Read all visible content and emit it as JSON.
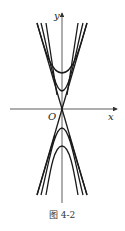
{
  "figure": {
    "caption": "图 4-2",
    "axes": {
      "x_label": "x",
      "y_label": "y",
      "origin_label": "O"
    },
    "colors": {
      "stroke": "#1a1a1a",
      "axis": "#333333",
      "background": "#ffffff"
    },
    "curves": [
      {
        "name": "asymptote-1",
        "type": "line",
        "through": "origin"
      },
      {
        "name": "asymptote-2",
        "type": "line",
        "through": "origin"
      },
      {
        "name": "upper-outer-branch",
        "type": "hyperbola-branch",
        "opens": "up"
      },
      {
        "name": "upper-inner-branch",
        "type": "hyperbola-branch",
        "opens": "up"
      },
      {
        "name": "lower-inner-branch",
        "type": "hyperbola-branch",
        "opens": "down"
      },
      {
        "name": "lower-outer-branch",
        "type": "hyperbola-branch",
        "opens": "down"
      }
    ]
  }
}
